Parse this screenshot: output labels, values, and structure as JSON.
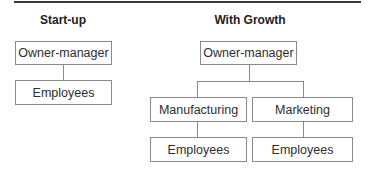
{
  "diagram": {
    "type": "org-chart-comparison",
    "panels": [
      {
        "title": "Start-up",
        "nodes": [
          {
            "id": "owner",
            "label": "Owner-manager"
          },
          {
            "id": "employees",
            "label": "Employees",
            "parent": "owner"
          }
        ]
      },
      {
        "title": "With Growth",
        "nodes": [
          {
            "id": "owner",
            "label": "Owner-manager"
          },
          {
            "id": "manufacturing",
            "label": "Manufacturing",
            "parent": "owner"
          },
          {
            "id": "marketing",
            "label": "Marketing",
            "parent": "owner"
          },
          {
            "id": "mfg-employees",
            "label": "Employees",
            "parent": "manufacturing"
          },
          {
            "id": "mkt-employees",
            "label": "Employees",
            "parent": "marketing"
          }
        ]
      }
    ]
  },
  "colors": {
    "rule": "#3a3a3a",
    "box_border": "#8a8a8a",
    "text": "#2e2e2e"
  }
}
